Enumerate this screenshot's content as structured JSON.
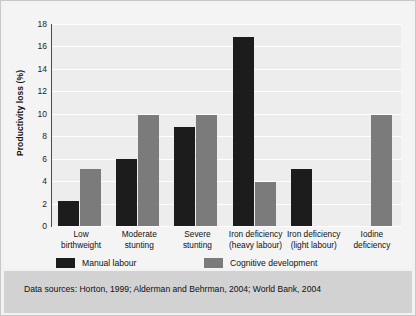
{
  "chart_data": {
    "type": "bar",
    "title": "",
    "subtitle": "",
    "xlabel": "",
    "ylabel": "Productivity loss (%)",
    "ylim": [
      0,
      18
    ],
    "ytick_step": 2,
    "yticks": [
      "18",
      "16",
      "14",
      "12",
      "10",
      "8",
      "6",
      "4",
      "2",
      "0"
    ],
    "grid": "horizontal",
    "legend_position": "bottom-left",
    "categories": [
      "Low\nbirthweight",
      "Moderate\nstunting",
      "Severe\nstunting",
      "Iron deficiency\n(heavy labour)",
      "Iron deficiency\n(light labour)",
      "Iodine\ndeficiency"
    ],
    "category_lines": [
      [
        "Low",
        "birthweight"
      ],
      [
        "Moderate",
        "stunting"
      ],
      [
        "Severe",
        "stunting"
      ],
      [
        "Iron deficiency",
        "(heavy labour)"
      ],
      [
        "Iron deficiency",
        "(light labour)"
      ],
      [
        "Iodine",
        "deficiency"
      ]
    ],
    "series": [
      {
        "name": "Manual labour",
        "color": "#1c1c1c",
        "values": [
          2.2,
          6.0,
          8.8,
          16.8,
          5.1,
          null
        ]
      },
      {
        "name": "Cognitive development",
        "color": "#7b7b7b",
        "values": [
          5.1,
          9.9,
          9.9,
          3.9,
          null,
          9.9
        ]
      }
    ]
  },
  "legend": {
    "items": [
      {
        "label": "Manual labour",
        "swatch": "dark"
      },
      {
        "label": "Cognitive development",
        "swatch": "grey"
      }
    ]
  },
  "footer": {
    "sources_text": "Data sources: Horton, 1999; Alderman and Behrman, 2004; World Bank, 2004"
  },
  "colors": {
    "series_manual_labour": "#1c1c1c",
    "series_cognitive_development": "#7b7b7b",
    "plot_background": "#ededed",
    "card_background": "#f4f4f4",
    "footer_background": "#d2d2d2",
    "gridline": "#ffffff",
    "axis": "#4a4a4a",
    "text": "#111111"
  }
}
